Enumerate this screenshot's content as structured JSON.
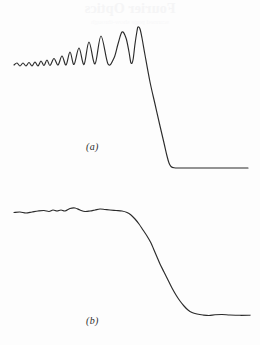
{
  "figure": {
    "background_color": "#fdfdfd",
    "ink_color": "#2b2b2b",
    "width": 260,
    "height": 345,
    "bleed_through_top": "Fourier Optics",
    "bleed_through_sub": "scanned page show-through"
  },
  "panels": [
    {
      "id": "a",
      "label": "(a)",
      "description": "oscillating fringe profile with growing amplitude rising to a single large maximum then falling steeply to a flat low baseline"
    },
    {
      "id": "b",
      "label": "(b)",
      "description": "smoothed monotonic edge profile: slightly rippled high plateau falling through an S-shaped transition to a flat low level"
    }
  ],
  "chart_data": [
    {
      "type": "line",
      "title": "(a)",
      "xlabel": "",
      "ylabel": "",
      "xlim": [
        0,
        260
      ],
      "ylim": [
        0,
        172
      ],
      "grid": false,
      "legend": "none",
      "series": [
        {
          "name": "fresnel-fringe-profile",
          "points": [
            [
              14,
              65
            ],
            [
              17,
              63
            ],
            [
              20,
              66
            ],
            [
              23,
              63
            ],
            [
              26,
              66
            ],
            [
              29,
              62.5
            ],
            [
              32,
              66
            ],
            [
              35,
              62
            ],
            [
              38,
              66
            ],
            [
              41,
              61
            ],
            [
              44,
              65.5
            ],
            [
              47,
              60
            ],
            [
              50,
              65.5
            ],
            [
              54,
              58.5
            ],
            [
              58,
              65
            ],
            [
              62,
              56
            ],
            [
              66,
              65
            ],
            [
              70,
              52
            ],
            [
              74,
              64.5
            ],
            [
              79,
              48
            ],
            [
              84,
              64.5
            ],
            [
              89,
              42
            ],
            [
              95,
              64
            ],
            [
              101,
              36
            ],
            [
              108,
              64
            ],
            [
              114,
              58
            ],
            [
              118,
              44
            ],
            [
              122,
              32
            ],
            [
              126,
              38
            ],
            [
              129,
              52
            ],
            [
              131,
              63
            ],
            [
              133,
              60
            ],
            [
              135,
              44
            ],
            [
              137,
              31
            ],
            [
              138,
              27
            ],
            [
              140,
              29
            ],
            [
              142,
              38
            ],
            [
              145,
              55
            ],
            [
              150,
              82
            ],
            [
              155,
              104
            ],
            [
              160,
              126
            ],
            [
              164,
              143
            ],
            [
              167,
              156
            ],
            [
              169,
              163
            ],
            [
              171,
              166.5
            ],
            [
              174,
              167.8
            ],
            [
              180,
              168
            ],
            [
              195,
              168
            ],
            [
              215,
              168
            ],
            [
              235,
              168
            ],
            [
              248,
              168
            ]
          ]
        }
      ]
    },
    {
      "type": "line",
      "title": "(b)",
      "xlabel": "",
      "ylabel": "",
      "xlim": [
        0,
        260
      ],
      "ylim": [
        190,
        345
      ],
      "grid": false,
      "legend": "none",
      "series": [
        {
          "name": "smoothed-edge-profile",
          "points": [
            [
              14,
              212.5
            ],
            [
              20,
              212
            ],
            [
              26,
              213
            ],
            [
              32,
              212
            ],
            [
              38,
              211
            ],
            [
              44,
              210.5
            ],
            [
              49,
              211.5
            ],
            [
              53,
              210
            ],
            [
              57,
              211
            ],
            [
              61,
              210
            ],
            [
              65,
              211
            ],
            [
              70,
              208.5
            ],
            [
              75,
              208
            ],
            [
              80,
              210
            ],
            [
              85,
              211.5
            ],
            [
              90,
              211
            ],
            [
              95,
              210
            ],
            [
              100,
              209
            ],
            [
              105,
              209.5
            ],
            [
              110,
              210
            ],
            [
              116,
              210.5
            ],
            [
              122,
              211
            ],
            [
              127,
              212.5
            ],
            [
              131,
              215
            ],
            [
              135,
              219
            ],
            [
              139,
              224
            ],
            [
              143,
              230
            ],
            [
              147,
              236
            ],
            [
              151,
              243
            ],
            [
              154,
              250
            ],
            [
              157,
              257
            ],
            [
              160,
              264
            ],
            [
              164,
              272
            ],
            [
              168,
              280
            ],
            [
              172,
              288
            ],
            [
              176,
              295
            ],
            [
              180,
              301
            ],
            [
              184,
              306
            ],
            [
              188,
              310
            ],
            [
              192,
              312.5
            ],
            [
              197,
              314
            ],
            [
              203,
              315
            ],
            [
              209,
              315.5
            ],
            [
              215,
              314.8
            ],
            [
              222,
              314.5
            ],
            [
              230,
              315
            ],
            [
              240,
              315.3
            ],
            [
              250,
              315.2
            ]
          ]
        }
      ]
    }
  ]
}
